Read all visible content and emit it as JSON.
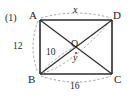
{
  "figure": {
    "item_number": "(1)",
    "vertices": [
      {
        "name": "A",
        "label": "A",
        "x": 40,
        "y": 20
      },
      {
        "name": "D",
        "label": "D",
        "x": 112,
        "y": 20
      },
      {
        "name": "B",
        "label": "B",
        "x": 40,
        "y": 74
      },
      {
        "name": "C",
        "label": "C",
        "x": 112,
        "y": 74
      },
      {
        "name": "O",
        "label": "O",
        "x": 76,
        "y": 47
      }
    ],
    "measurements": [
      {
        "name": "top-side-AD",
        "label": "x",
        "value": "x",
        "kind": "variable"
      },
      {
        "name": "left-side-AB",
        "label": "12",
        "value": "12",
        "kind": "number"
      },
      {
        "name": "bottom-side-BC",
        "label": "16",
        "value": "16",
        "kind": "number"
      },
      {
        "name": "segment-BO",
        "label": "10",
        "value": "10",
        "kind": "number"
      },
      {
        "name": "segment-OC",
        "label": "y",
        "value": "y",
        "kind": "variable"
      }
    ],
    "colors": {
      "stroke": "#2b2b2b",
      "dashed": "#8a8a8a",
      "text": "#1c1c1c",
      "background": "#ffffff"
    }
  }
}
